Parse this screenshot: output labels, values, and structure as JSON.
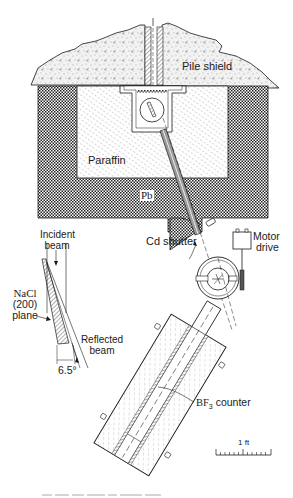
{
  "diagram": {
    "labels": {
      "pile_shield": "Pile shield",
      "paraffin": "Paraffin",
      "lead": "Pb",
      "cd_shutter": "Cd shutter",
      "motor_drive_line1": "Motor",
      "motor_drive_line2": "drive",
      "incident_beam_line1": "Incident",
      "incident_beam_line2": "beam",
      "nacl_line1": "NaCl",
      "nacl_line2": "(200)",
      "nacl_line3": "plane",
      "reflected_beam_line1": "Reflected",
      "reflected_beam_line2": "beam",
      "angle": "6.5°",
      "counter_prefix": "BF",
      "counter_sub": "3",
      "counter_suffix": " counter",
      "scale": "1 ft"
    },
    "components": [
      "pile-shield",
      "lead-shield",
      "paraffin-block",
      "collimator-slot",
      "crystal-housing",
      "beam-tube",
      "cd-shutter",
      "motor-drive",
      "spectrometer-table",
      "bf3-counter-assembly",
      "scale-bar",
      "nacl-crystal-inset"
    ],
    "colors": {
      "ink": "#1a1a1a",
      "background": "#ffffff",
      "shield_fill": "#e8e8e8",
      "paraffin_fill": "#eeeeee",
      "lead_fill": "#7a7a7a"
    },
    "caption_visible": false
  }
}
